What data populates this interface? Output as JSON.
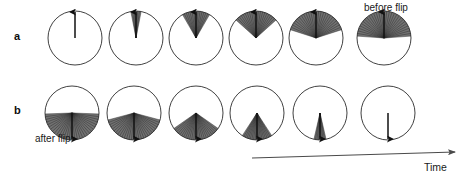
{
  "figure": {
    "type": "directional-distribution-time-series",
    "width": 467,
    "height": 179,
    "background": "#ffffff",
    "stroke_color": "#2b2b2b",
    "wedge_fill": "#3a3a3a",
    "arrow_color": "#111111"
  },
  "panels": [
    {
      "id": "a",
      "label": "a",
      "row_center_y": 38,
      "description": "distribution broadens before flip",
      "circles": [
        {
          "index": 0,
          "cx": 75,
          "cy": 38,
          "r": 27,
          "direction": "up",
          "half_spread_deg": 0,
          "n_rays": 0,
          "wedge": false,
          "arrow": true,
          "arrow_len": 26
        },
        {
          "index": 1,
          "cx": 136,
          "cy": 38,
          "r": 27,
          "direction": "up",
          "half_spread_deg": 11,
          "n_rays": 7,
          "wedge": true,
          "arrow": true,
          "arrow_len": 26
        },
        {
          "index": 2,
          "cx": 196,
          "cy": 38,
          "r": 27,
          "direction": "up",
          "half_spread_deg": 30,
          "n_rays": 15,
          "wedge": true,
          "arrow": true,
          "arrow_len": 26
        },
        {
          "index": 3,
          "cx": 256,
          "cy": 38,
          "r": 27,
          "direction": "up",
          "half_spread_deg": 48,
          "n_rays": 21,
          "wedge": true,
          "arrow": true,
          "arrow_len": 26
        },
        {
          "index": 4,
          "cx": 316,
          "cy": 38,
          "r": 27,
          "direction": "up",
          "half_spread_deg": 72,
          "n_rays": 27,
          "wedge": true,
          "arrow": true,
          "arrow_len": 26
        },
        {
          "index": 5,
          "cx": 384,
          "cy": 38,
          "r": 27,
          "direction": "up",
          "half_spread_deg": 86,
          "n_rays": 31,
          "wedge": true,
          "arrow": true,
          "arrow_len": 26
        }
      ]
    },
    {
      "id": "b",
      "label": "b",
      "row_center_y": 113,
      "description": "distribution narrows after flip",
      "circles": [
        {
          "index": 0,
          "cx": 72,
          "cy": 113,
          "r": 27,
          "direction": "down",
          "half_spread_deg": 88,
          "n_rays": 31,
          "wedge": true,
          "arrow": true,
          "arrow_len": 26
        },
        {
          "index": 1,
          "cx": 134,
          "cy": 113,
          "r": 27,
          "direction": "down",
          "half_spread_deg": 75,
          "n_rays": 29,
          "wedge": true,
          "arrow": true,
          "arrow_len": 26
        },
        {
          "index": 2,
          "cx": 196,
          "cy": 113,
          "r": 27,
          "direction": "down",
          "half_spread_deg": 55,
          "n_rays": 25,
          "wedge": true,
          "arrow": true,
          "arrow_len": 26
        },
        {
          "index": 3,
          "cx": 257,
          "cy": 113,
          "r": 27,
          "direction": "down",
          "half_spread_deg": 33,
          "n_rays": 19,
          "wedge": true,
          "arrow": true,
          "arrow_len": 26
        },
        {
          "index": 4,
          "cx": 320,
          "cy": 113,
          "r": 27,
          "direction": "down",
          "half_spread_deg": 13,
          "n_rays": 9,
          "wedge": true,
          "arrow": true,
          "arrow_len": 26
        },
        {
          "index": 5,
          "cx": 388,
          "cy": 113,
          "r": 27,
          "direction": "down",
          "half_spread_deg": 0,
          "n_rays": 0,
          "wedge": false,
          "arrow": true,
          "arrow_len": 26
        }
      ]
    }
  ],
  "annotations": {
    "before_flip": "before flip",
    "after_flip": "after flip",
    "time_label": "Time"
  },
  "time_axis": {
    "x1": 252,
    "x2": 455,
    "y1": 158,
    "y2": 152,
    "label": "Time",
    "arrowhead": "right"
  }
}
